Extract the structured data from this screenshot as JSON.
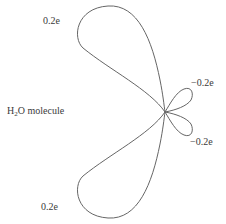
{
  "diagram": {
    "title": "H2O molecule",
    "molecule_label": {
      "prefix": "H",
      "subscript": "2",
      "suffix": "O molecule"
    },
    "charges": {
      "upper_left": "0.2e",
      "lower_left": "0.2e",
      "upper_right": "−0.2e",
      "lower_right": "−0.2e"
    },
    "stroke_color": "#666666",
    "text_color": "#3a3a3a"
  }
}
